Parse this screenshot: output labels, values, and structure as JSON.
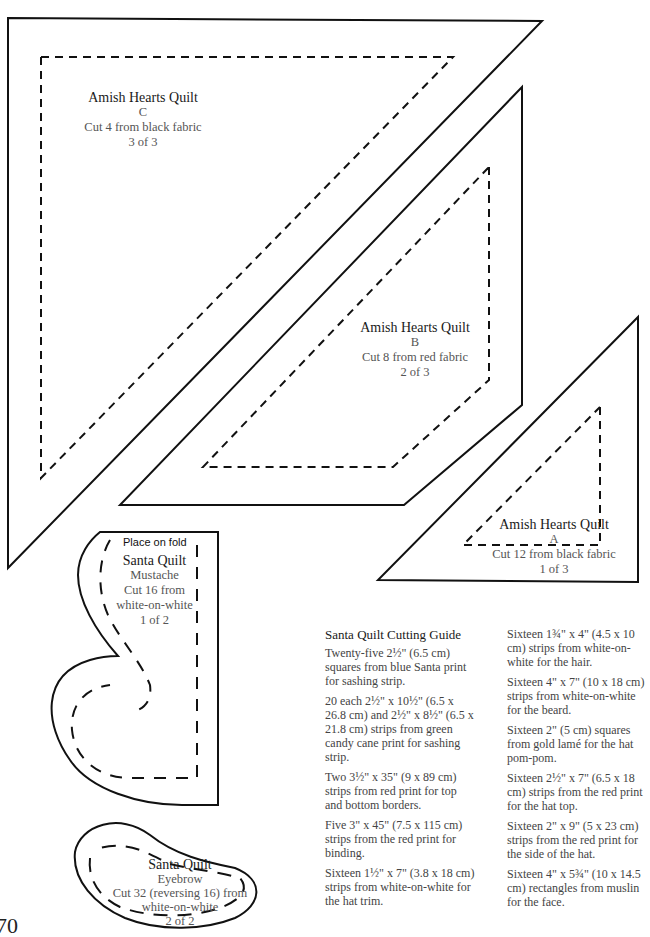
{
  "templates": {
    "c": {
      "title": "Amish Hearts Quilt",
      "piece": "C",
      "instruction": "Cut 4 from black fabric",
      "page": "3 of 3"
    },
    "b": {
      "title": "Amish Hearts Quilt",
      "piece": "B",
      "instruction": "Cut 8 from red fabric",
      "page": "2 of 3"
    },
    "a": {
      "title": "Amish Hearts Quilt",
      "piece": "A",
      "instruction": "Cut 12 from black fabric",
      "page": "1 of 3"
    },
    "mustache": {
      "fold_note": "Place on fold",
      "title": "Santa Quilt",
      "piece": "Mustache",
      "instruction_1": "Cut 16 from",
      "instruction_2": "white-on-white",
      "page": "1 of 2"
    },
    "eyebrow": {
      "title": "Santa Quilt",
      "piece": "Eyebrow",
      "instruction_1": "Cut 32 (reversing 16) from",
      "instruction_2": "white-on-white",
      "page": "2 of 2"
    }
  },
  "cutting_guide": {
    "heading": "Santa Quilt Cutting Guide",
    "left_items": [
      "Twenty-five 2½\" (6.5 cm) squares from blue Santa print for sashing strip.",
      "20 each 2½\" x 10½\" (6.5 x 26.8 cm) and 2½\" x 8½\" (6.5 x 21.8 cm) strips from green candy cane print for sashing strip.",
      "Two 3½\" x 35\" (9 x 89 cm) strips from red print for top and bottom borders.",
      "Five 3\" x 45\" (7.5 x 115 cm) strips from the red print for binding.",
      "Sixteen 1½\" x 7\" (3.8 x 18 cm) strips from white-on-white for the hat trim."
    ],
    "right_items": [
      "Sixteen 1¾\" x 4\" (4.5 x 10 cm) strips from white-on-white for the hair.",
      "Sixteen 4\" x 7\" (10 x 18 cm) strips from white-on-white for the beard.",
      "Sixteen 2\" (5 cm) squares from gold lamé for the hat pom-pom.",
      "Sixteen 2½\" x 7\" (6.5 x 18 cm) strips from the red print for the hat top.",
      "Sixteen 2\" x 9\" (5 x 23 cm) strips from the red print for the side of the hat.",
      "Sixteen 4\" x 5¾\" (10 x 14.5 cm) rectangles from muslin for the face."
    ]
  },
  "page_number": "70"
}
